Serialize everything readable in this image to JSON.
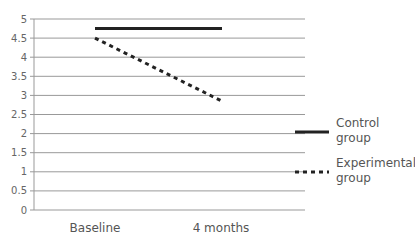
{
  "chart_data": {
    "type": "line",
    "title": "",
    "xlabel": "",
    "ylabel": "",
    "categories": [
      "Baseline",
      "4 months"
    ],
    "series": [
      {
        "name": "Control group",
        "style": "solid",
        "color": "#222222",
        "values": [
          4.75,
          4.75
        ]
      },
      {
        "name": "Experimental group",
        "style": "dashed",
        "color": "#222222",
        "values": [
          4.5,
          2.85
        ]
      }
    ],
    "ylim": [
      0,
      5
    ],
    "yticks": [
      "0",
      "0.5",
      "1",
      "1.5",
      "2",
      "2.5",
      "3",
      "3.5",
      "4",
      "4.5",
      "5"
    ],
    "grid": true,
    "legend_position": "right"
  },
  "legend": {
    "control_line1": "Control",
    "control_line2": "group",
    "experimental_line1": "Experimental",
    "experimental_line2": "group"
  }
}
